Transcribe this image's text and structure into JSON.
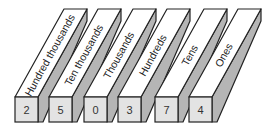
{
  "diagram": {
    "type": "place-value-chart",
    "columns": [
      {
        "label": "Hundred thousands",
        "digit": "2"
      },
      {
        "label": "Ten thousands",
        "digit": "5"
      },
      {
        "label": "Thousands",
        "digit": "0"
      },
      {
        "label": "Hundreds",
        "digit": "3"
      },
      {
        "label": "Tens",
        "digit": "7"
      },
      {
        "label": "Ones",
        "digit": "4"
      }
    ],
    "colors": {
      "top_face": "#ffffff",
      "side_face": "#b5b5b5",
      "front_face": "#e3e3e3",
      "outline": "#222222"
    }
  }
}
